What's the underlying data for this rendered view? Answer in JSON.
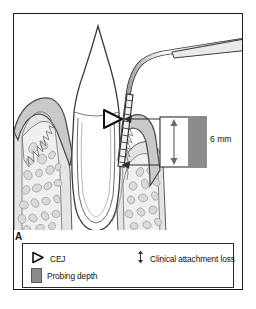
{
  "figure": {
    "panel_label": "A",
    "measurement_label": "6 mm"
  },
  "legend": {
    "items": [
      {
        "id": "cej",
        "icon": "triangle-outline-icon",
        "label": "CEJ"
      },
      {
        "id": "probing-depth",
        "icon": "gray-swatch-icon",
        "label": "Probing depth"
      },
      {
        "id": "clinical-attachment-loss",
        "icon": "double-arrow-vertical-icon",
        "label": "Clinical attachment loss"
      }
    ]
  },
  "colors": {
    "frame": "#1a1a1a",
    "probing_depth_bar": "#8c8c8c",
    "gingiva_fill": "#d6d6d6",
    "bone_fill": "#e8e8e8",
    "tooth_fill": "#ffffff",
    "outline": "#4a4a4a",
    "text": "#111111"
  },
  "anatomy": {
    "structures": [
      "tooth-crown",
      "tooth-root",
      "periodontal-ligament",
      "gingiva-left",
      "gingiva-right",
      "alveolar-bone",
      "trabecular-bone",
      "periodontal-probe",
      "cej-marker",
      "probing-depth-bar",
      "clinical-attachment-loss-arrow"
    ]
  }
}
